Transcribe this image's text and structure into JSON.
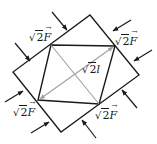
{
  "diagram": {
    "colors": {
      "stroke": "#1a1a1a",
      "diagonal_gray": "#a0a0a0",
      "background": "#ffffff"
    },
    "outer_square": {
      "points": [
        [
          90,
          15
        ],
        [
          139,
          75
        ],
        [
          61,
          132
        ],
        [
          13,
          72
        ]
      ]
    },
    "inner_quadrilateral": {
      "points": [
        [
          51,
          45
        ],
        [
          115,
          46
        ],
        [
          99,
          104
        ],
        [
          38,
          100
        ]
      ]
    },
    "diagonals": [
      {
        "from": [
          51,
          45
        ],
        "to": [
          99,
          104
        ],
        "style": "plain"
      },
      {
        "from": [
          38,
          100
        ],
        "to": [
          115,
          46
        ],
        "style": "double-arrow",
        "label": "√2l"
      }
    ],
    "force_arrows": [
      {
        "from": [
          52,
          12
        ],
        "to": [
          67,
          30
        ]
      },
      {
        "from": [
          15,
          43
        ],
        "to": [
          30,
          61
        ]
      },
      {
        "from": [
          131,
          20
        ],
        "to": [
          113,
          31
        ]
      },
      {
        "from": [
          152,
          50
        ],
        "to": [
          134,
          61
        ]
      },
      {
        "from": [
          137,
          108
        ],
        "to": [
          122,
          90
        ]
      },
      {
        "from": [
          96,
          138
        ],
        "to": [
          82,
          120
        ]
      },
      {
        "from": [
          5,
          102
        ],
        "to": [
          23,
          91
        ]
      },
      {
        "from": [
          31,
          133
        ],
        "to": [
          49,
          122
        ]
      }
    ],
    "labels": {
      "top_left": {
        "radicand": "2",
        "symbol": "F",
        "text": "√2F"
      },
      "top_right": {
        "radicand": "2",
        "symbol": "F",
        "text": "√2F"
      },
      "bottom_left": {
        "radicand": "2",
        "symbol": "F",
        "text": "√2F"
      },
      "bottom_right": {
        "radicand": "2",
        "symbol": "F",
        "text": "√2F"
      },
      "diagonal": {
        "radicand": "2",
        "symbol": "l",
        "text": "√2l"
      }
    },
    "radical_sign": "√",
    "vector_arrow": "→"
  }
}
